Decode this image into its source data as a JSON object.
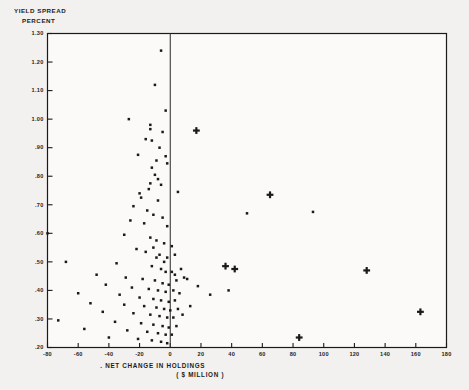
{
  "chart_data": {
    "type": "scatter",
    "title_line1": "YIELD SPREAD",
    "title_line2": "PERCENT",
    "xlabel": ". NET CHANGE IN HOLDINGS",
    "xlabel_line2": "( $ MILLION )",
    "ylabel": "YIELD SPREAD PERCENT",
    "xlim": [
      -80,
      180
    ],
    "ylim": [
      0.2,
      1.3
    ],
    "grid": false,
    "legend": "none",
    "xticks": [
      -80,
      -60,
      -40,
      -20,
      0,
      20,
      40,
      60,
      80,
      100,
      120,
      140,
      160,
      180
    ],
    "xticklabels": [
      "-80",
      "-60",
      "-40",
      "-20",
      "0",
      "20",
      "40",
      "60",
      "80",
      "100",
      "120",
      "140",
      "160",
      "180"
    ],
    "yticks": [
      0.2,
      0.3,
      0.4,
      0.5,
      0.6,
      0.7,
      0.8,
      0.9,
      1.0,
      1.1,
      1.2,
      1.3
    ],
    "yticklabels": [
      ".20",
      ".30",
      ".40",
      ".50",
      ".60",
      ".70",
      ".80",
      ".90",
      "1.00",
      "1.10",
      "1.20",
      "1.30"
    ],
    "reference_line_x": 0,
    "marker_colors": {
      "dot": "#141414",
      "plus": "#141414"
    },
    "series": [
      {
        "name": "dot",
        "marker": "dot",
        "points": [
          [
            -6,
            1.24
          ],
          [
            -10,
            1.12
          ],
          [
            -3,
            1.03
          ],
          [
            -27,
            1.0
          ],
          [
            -13,
            0.98
          ],
          [
            -13,
            0.965
          ],
          [
            -5,
            0.955
          ],
          [
            -16,
            0.93
          ],
          [
            -12,
            0.925
          ],
          [
            -7,
            0.9
          ],
          [
            -21,
            0.875
          ],
          [
            -3,
            0.87
          ],
          [
            -9,
            0.855
          ],
          [
            -2,
            0.845
          ],
          [
            -12,
            0.83
          ],
          [
            -10,
            0.805
          ],
          [
            -8,
            0.79
          ],
          [
            -13,
            0.775
          ],
          [
            -6,
            0.77
          ],
          [
            -14,
            0.755
          ],
          [
            -20,
            0.74
          ],
          [
            -19,
            0.725
          ],
          [
            -8,
            0.715
          ],
          [
            5,
            0.745
          ],
          [
            -24,
            0.695
          ],
          [
            -15,
            0.68
          ],
          [
            -11,
            0.665
          ],
          [
            -5,
            0.655
          ],
          [
            -26,
            0.645
          ],
          [
            -17,
            0.635
          ],
          [
            -2,
            0.625
          ],
          [
            -80,
            0.6
          ],
          [
            -30,
            0.595
          ],
          [
            -13,
            0.585
          ],
          [
            -9,
            0.575
          ],
          [
            -4,
            0.565
          ],
          [
            1,
            0.555
          ],
          [
            -22,
            0.545
          ],
          [
            -16,
            0.535
          ],
          [
            -7,
            0.525
          ],
          [
            -2,
            0.515
          ],
          [
            3,
            0.525
          ],
          [
            -68,
            0.5
          ],
          [
            -35,
            0.495
          ],
          [
            -12,
            0.485
          ],
          [
            -6,
            0.475
          ],
          [
            -3,
            0.465
          ],
          [
            1,
            0.465
          ],
          [
            3,
            0.455
          ],
          [
            -48,
            0.455
          ],
          [
            -29,
            0.445
          ],
          [
            -18,
            0.44
          ],
          [
            -10,
            0.435
          ],
          [
            -5,
            0.425
          ],
          [
            -1,
            0.42
          ],
          [
            4,
            0.435
          ],
          [
            9,
            0.445
          ],
          [
            -42,
            0.42
          ],
          [
            -25,
            0.41
          ],
          [
            -14,
            0.405
          ],
          [
            -8,
            0.4
          ],
          [
            -3,
            0.395
          ],
          [
            2,
            0.4
          ],
          [
            6,
            0.39
          ],
          [
            18,
            0.415
          ],
          [
            -60,
            0.39
          ],
          [
            -33,
            0.385
          ],
          [
            -20,
            0.375
          ],
          [
            -11,
            0.37
          ],
          [
            -6,
            0.365
          ],
          [
            -1,
            0.36
          ],
          [
            3,
            0.365
          ],
          [
            26,
            0.385
          ],
          [
            38,
            0.4
          ],
          [
            -52,
            0.355
          ],
          [
            -30,
            0.35
          ],
          [
            -17,
            0.345
          ],
          [
            -9,
            0.34
          ],
          [
            -4,
            0.335
          ],
          [
            0,
            0.33
          ],
          [
            5,
            0.335
          ],
          [
            13,
            0.345
          ],
          [
            -44,
            0.325
          ],
          [
            -24,
            0.32
          ],
          [
            -13,
            0.315
          ],
          [
            -7,
            0.31
          ],
          [
            -2,
            0.305
          ],
          [
            2,
            0.305
          ],
          [
            8,
            0.315
          ],
          [
            -73,
            0.295
          ],
          [
            -36,
            0.29
          ],
          [
            -19,
            0.285
          ],
          [
            -11,
            0.28
          ],
          [
            -5,
            0.275
          ],
          [
            -1,
            0.27
          ],
          [
            4,
            0.275
          ],
          [
            -56,
            0.265
          ],
          [
            -28,
            0.26
          ],
          [
            -15,
            0.255
          ],
          [
            -8,
            0.25
          ],
          [
            -3,
            0.245
          ],
          [
            1,
            0.245
          ],
          [
            -40,
            0.235
          ],
          [
            -21,
            0.23
          ],
          [
            -12,
            0.225
          ],
          [
            -6,
            0.22
          ],
          [
            -2,
            0.215
          ],
          [
            50,
            0.67
          ],
          [
            93,
            0.675
          ],
          [
            -11,
            0.55
          ],
          [
            -9,
            0.515
          ],
          [
            -4,
            0.5
          ],
          [
            7,
            0.475
          ],
          [
            11,
            0.44
          ]
        ]
      },
      {
        "name": "plus",
        "marker": "plus",
        "points": [
          [
            17,
            0.96
          ],
          [
            65,
            0.735
          ],
          [
            36,
            0.485
          ],
          [
            42,
            0.475
          ],
          [
            128,
            0.47
          ],
          [
            163,
            0.325
          ],
          [
            84,
            0.235
          ]
        ]
      }
    ]
  }
}
